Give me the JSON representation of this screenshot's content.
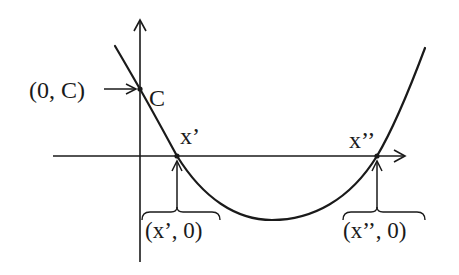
{
  "diagram": {
    "type": "parabola-roots",
    "colors": {
      "stroke": "#1a1a1a",
      "background": "#ffffff"
    },
    "labels": {
      "y_intercept_point": "(0, C)",
      "y_intercept_mark": "C",
      "root1_mark": "x’",
      "root2_mark": "x’’",
      "root1_point": "(x’, 0)",
      "root2_point": "(x’’, 0)"
    },
    "axes": {
      "x_axis": {
        "from": [
          53,
          156
        ],
        "to": [
          405,
          156
        ]
      },
      "y_axis": {
        "from": [
          140,
          262
        ],
        "to": [
          140,
          20
        ]
      }
    },
    "points": {
      "y_intercept": [
        140,
        89
      ],
      "root1": [
        177,
        156
      ],
      "root2": [
        377,
        156
      ],
      "vertex": [
        270,
        220
      ]
    }
  }
}
